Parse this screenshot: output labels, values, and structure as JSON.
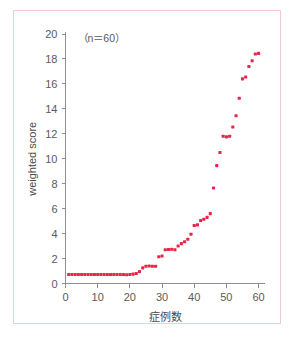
{
  "figure": {
    "annotation": "（n＝60）",
    "frame_color": "#f0cbd3",
    "background": "#ffffff"
  },
  "chart_data": {
    "type": "scatter",
    "title": "",
    "xlabel": "症例数",
    "ylabel": "weighted score",
    "annotation": "（n＝60）",
    "xlim": [
      0,
      62
    ],
    "ylim": [
      0,
      20
    ],
    "xticks": [
      0,
      10,
      20,
      30,
      40,
      50,
      60
    ],
    "yticks": [
      0,
      2,
      4,
      6,
      8,
      10,
      12,
      14,
      16,
      18,
      20
    ],
    "xtick_labels": [
      "0",
      "10",
      "20",
      "30",
      "40",
      "50",
      "60"
    ],
    "ytick_labels": [
      "0",
      "2",
      "4",
      "6",
      "8",
      "10",
      "12",
      "14",
      "16",
      "18",
      "20"
    ],
    "grid": false,
    "legend": false,
    "marker_color": "#e8264a",
    "marker_size": 3.1,
    "n": 60,
    "series": [
      {
        "name": "weighted score",
        "color": "#e8264a",
        "x": [
          1,
          2,
          3,
          4,
          5,
          6,
          7,
          8,
          9,
          10,
          11,
          12,
          13,
          14,
          15,
          16,
          17,
          18,
          19,
          20,
          21,
          22,
          23,
          24,
          25,
          26,
          27,
          28,
          29,
          30,
          31,
          32,
          33,
          34,
          35,
          36,
          37,
          38,
          39,
          40,
          41,
          42,
          43,
          44,
          45,
          46,
          47,
          48,
          49,
          50,
          51,
          52,
          53,
          54,
          55,
          56,
          57,
          58,
          59,
          60
        ],
        "y": [
          0.72,
          0.72,
          0.72,
          0.72,
          0.72,
          0.72,
          0.72,
          0.72,
          0.72,
          0.72,
          0.72,
          0.72,
          0.72,
          0.72,
          0.72,
          0.72,
          0.72,
          0.72,
          0.7,
          0.72,
          0.75,
          0.8,
          0.95,
          1.25,
          1.38,
          1.4,
          1.38,
          1.38,
          2.15,
          2.2,
          2.7,
          2.72,
          2.75,
          2.7,
          3.0,
          3.2,
          3.35,
          3.55,
          3.95,
          4.65,
          4.7,
          5.05,
          5.15,
          5.3,
          5.6,
          7.65,
          9.45,
          10.5,
          11.8,
          11.75,
          11.8,
          12.55,
          13.45,
          14.85,
          16.4,
          16.55,
          17.4,
          17.85,
          18.4,
          18.45
        ]
      }
    ]
  }
}
